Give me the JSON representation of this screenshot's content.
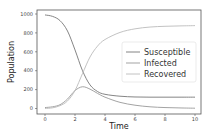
{
  "chart_data": {
    "type": "line",
    "title": "",
    "xlabel": "Time",
    "ylabel": "Population",
    "xlim": [
      -0.5,
      10.5
    ],
    "ylim": [
      -50,
      1050
    ],
    "xticks": [
      "0",
      "2",
      "4",
      "6",
      "8",
      "10"
    ],
    "yticks": [
      "0",
      "200",
      "400",
      "600",
      "800",
      "1000"
    ],
    "grid": false,
    "legend_position": "center right",
    "x": [
      0,
      0.5,
      1,
      1.5,
      2,
      2.5,
      3,
      3.5,
      4,
      5,
      6,
      7,
      8,
      9,
      10
    ],
    "series": [
      {
        "name": "Susceptible",
        "color": "#777777",
        "values": [
          990,
          975,
          930,
          820,
          620,
          400,
          250,
          180,
          150,
          130,
          122,
          120,
          120,
          120,
          120
        ]
      },
      {
        "name": "Infected",
        "color": "#999999",
        "values": [
          10,
          18,
          40,
          100,
          190,
          230,
          205,
          160,
          120,
          65,
          35,
          18,
          10,
          6,
          3
        ]
      },
      {
        "name": "Recovered",
        "color": "#bbbbbb",
        "values": [
          0,
          7,
          30,
          80,
          190,
          370,
          545,
          660,
          730,
          805,
          843,
          862,
          870,
          874,
          877
        ]
      }
    ]
  },
  "legend": {
    "items": [
      {
        "label": "Susceptible",
        "color": "#777777"
      },
      {
        "label": "Infected",
        "color": "#999999"
      },
      {
        "label": "Recovered",
        "color": "#bbbbbb"
      }
    ]
  },
  "axes": {
    "xlabel": "Time",
    "ylabel": "Population"
  }
}
